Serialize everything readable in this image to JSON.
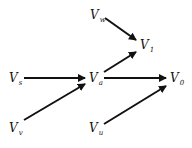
{
  "diagram": {
    "type": "directed-graph",
    "nodes": [
      {
        "id": "Vw",
        "base": "V",
        "sub": "w",
        "x": 90,
        "y": 9
      },
      {
        "id": "V1",
        "base": "V",
        "sub": "1",
        "x": 140,
        "y": 39
      },
      {
        "id": "Vs",
        "base": "V",
        "sub": "s",
        "x": 9,
        "y": 72
      },
      {
        "id": "Va",
        "base": "V",
        "sub": "a",
        "x": 89,
        "y": 72
      },
      {
        "id": "V0",
        "base": "V",
        "sub": "0",
        "x": 170,
        "y": 72
      },
      {
        "id": "Vv",
        "base": "V",
        "sub": "v",
        "x": 9,
        "y": 122
      },
      {
        "id": "Vu",
        "base": "V",
        "sub": "u",
        "x": 89,
        "y": 122
      }
    ],
    "edges": [
      {
        "from": "Vw",
        "to": "V1"
      },
      {
        "from": "Va",
        "to": "V1"
      },
      {
        "from": "Vs",
        "to": "Va"
      },
      {
        "from": "Vv",
        "to": "Va"
      },
      {
        "from": "Va",
        "to": "V0"
      },
      {
        "from": "Vu",
        "to": "V0"
      }
    ],
    "colors": {
      "line": "#111111",
      "background": "#ffffff"
    }
  }
}
